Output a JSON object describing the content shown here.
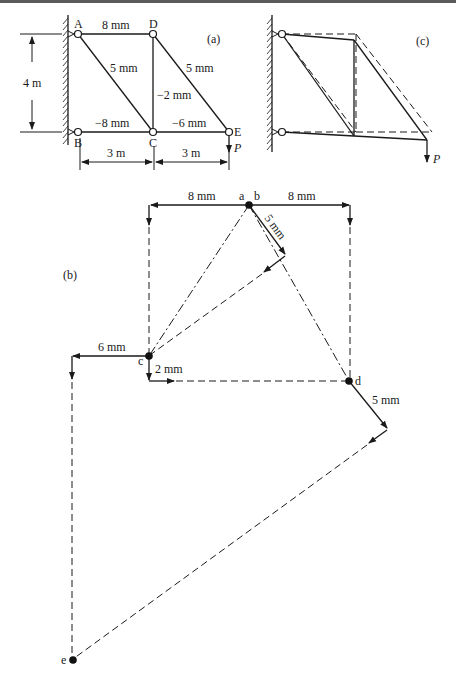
{
  "figure_a": {
    "label": "(a)",
    "joints": {
      "A": "A",
      "B": "B",
      "C": "C",
      "D": "D",
      "E": "E"
    },
    "members": {
      "AD": "8 mm",
      "AC": "5 mm",
      "DC": "−2 mm",
      "DE": "5 mm",
      "BC": "−8 mm",
      "CE": "−6 mm"
    },
    "dimensions": {
      "height": "4 m",
      "span1": "3 m",
      "span2": "3 m"
    },
    "load": "P"
  },
  "figure_b": {
    "label": "(b)",
    "points": {
      "a": "a",
      "b": "b",
      "c": "c",
      "d": "d",
      "e": "e"
    },
    "vectors": {
      "a_left": "8 mm",
      "b_right": "8 mm",
      "b_diag": "5 mm",
      "c_left": "6 mm",
      "c_down": "2 mm",
      "d_diag": "5 mm"
    }
  },
  "figure_c": {
    "label": "(c)",
    "load": "P"
  }
}
